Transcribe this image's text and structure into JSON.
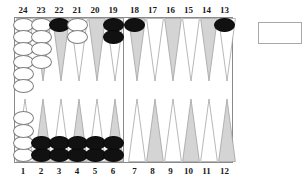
{
  "board": {
    "title": "backgammon-board",
    "colors": {
      "triangle_shaded": "#d4d4d4",
      "triangle_light": "#ffffff",
      "triangle_outline": "#9a9a9a",
      "checker_white": "#ffffff",
      "checker_black": "#111111",
      "board_outline": "#8a8a8a",
      "label_text": "#1a1a1a"
    },
    "top_labels": [
      "24",
      "23",
      "22",
      "21",
      "20",
      "19",
      "18",
      "17",
      "16",
      "15",
      "14",
      "13"
    ],
    "bottom_labels": [
      "1",
      "2",
      "3",
      "4",
      "5",
      "6",
      "7",
      "8",
      "9",
      "10",
      "11",
      "12"
    ],
    "points": [
      {
        "label": "24",
        "quadrant": "top-left",
        "index": 0,
        "shade": "light",
        "checkers": 6,
        "color": "white"
      },
      {
        "label": "23",
        "quadrant": "top-left",
        "index": 1,
        "shade": "shaded",
        "checkers": 4,
        "color": "white"
      },
      {
        "label": "22",
        "quadrant": "top-left",
        "index": 2,
        "shade": "shaded",
        "checkers": 1,
        "color": "black"
      },
      {
        "label": "21",
        "quadrant": "top-left",
        "index": 3,
        "shade": "light",
        "checkers": 2,
        "color": "white"
      },
      {
        "label": "20",
        "quadrant": "top-left",
        "index": 4,
        "shade": "shaded",
        "checkers": 0,
        "color": "none"
      },
      {
        "label": "19",
        "quadrant": "top-left",
        "index": 5,
        "shade": "light",
        "checkers": 2,
        "color": "black"
      },
      {
        "label": "18",
        "quadrant": "top-right",
        "index": 0,
        "shade": "shaded",
        "checkers": 1,
        "color": "black"
      },
      {
        "label": "17",
        "quadrant": "top-right",
        "index": 1,
        "shade": "light",
        "checkers": 0,
        "color": "none"
      },
      {
        "label": "16",
        "quadrant": "top-right",
        "index": 2,
        "shade": "shaded",
        "checkers": 0,
        "color": "none"
      },
      {
        "label": "15",
        "quadrant": "top-right",
        "index": 3,
        "shade": "light",
        "checkers": 0,
        "color": "none"
      },
      {
        "label": "14",
        "quadrant": "top-right",
        "index": 4,
        "shade": "shaded",
        "checkers": 0,
        "color": "none"
      },
      {
        "label": "13",
        "quadrant": "top-right",
        "index": 5,
        "shade": "light",
        "checkers": 1,
        "color": "black"
      },
      {
        "label": "1",
        "quadrant": "bottom-left",
        "index": 0,
        "shade": "light",
        "checkers": 4,
        "color": "white"
      },
      {
        "label": "2",
        "quadrant": "bottom-left",
        "index": 1,
        "shade": "shaded",
        "checkers": 2,
        "color": "black"
      },
      {
        "label": "3",
        "quadrant": "bottom-left",
        "index": 2,
        "shade": "light",
        "checkers": 2,
        "color": "black"
      },
      {
        "label": "4",
        "quadrant": "bottom-left",
        "index": 3,
        "shade": "shaded",
        "checkers": 2,
        "color": "black"
      },
      {
        "label": "5",
        "quadrant": "bottom-left",
        "index": 4,
        "shade": "light",
        "checkers": 2,
        "color": "black"
      },
      {
        "label": "6",
        "quadrant": "bottom-left",
        "index": 5,
        "shade": "shaded",
        "checkers": 2,
        "color": "black"
      },
      {
        "label": "7",
        "quadrant": "bottom-right",
        "index": 0,
        "shade": "light",
        "checkers": 0,
        "color": "none"
      },
      {
        "label": "8",
        "quadrant": "bottom-right",
        "index": 1,
        "shade": "shaded",
        "checkers": 0,
        "color": "none"
      },
      {
        "label": "9",
        "quadrant": "bottom-right",
        "index": 2,
        "shade": "light",
        "checkers": 0,
        "color": "none"
      },
      {
        "label": "10",
        "quadrant": "bottom-right",
        "index": 3,
        "shade": "shaded",
        "checkers": 0,
        "color": "none"
      },
      {
        "label": "11",
        "quadrant": "bottom-right",
        "index": 4,
        "shade": "light",
        "checkers": 0,
        "color": "none"
      },
      {
        "label": "12",
        "quadrant": "bottom-right",
        "index": 5,
        "shade": "shaded",
        "checkers": 0,
        "color": "none"
      }
    ],
    "bearoff_tray": {
      "label": "",
      "contents": ""
    }
  }
}
